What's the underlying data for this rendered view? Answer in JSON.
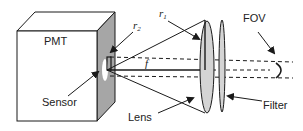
{
  "diagram": {
    "labels": {
      "pmt": "PMT",
      "sensor": "Sensor",
      "lens": "Lens",
      "filter": "Filter",
      "fov": "FOV",
      "r1": "r",
      "r1_sub": "1",
      "r2": "r",
      "r2_sub": "2",
      "f": "f"
    },
    "colors": {
      "stroke": "#1a1a1a",
      "side_face": "#a6a6a6",
      "lens_fill": "#d4d4d4",
      "background": "#ffffff"
    }
  }
}
